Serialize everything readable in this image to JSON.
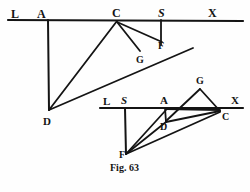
{
  "figure": {
    "caption": "Fig. 63",
    "caption_pos": {
      "x": 110,
      "y": 162,
      "size": 10
    },
    "background": "#fefefe",
    "ink": "#141414",
    "diagrams": [
      {
        "name": "upper-diagram",
        "baseline": {
          "label_line": "L A C S X",
          "y": 20,
          "x1": 8,
          "x2": 243
        },
        "points": [
          {
            "id": "L",
            "label": "L",
            "style": "bold",
            "x": 11,
            "y": 8,
            "size": 12,
            "vertex_x": 16,
            "vertex_y": 20
          },
          {
            "id": "A",
            "label": "A",
            "style": "bold",
            "x": 37,
            "y": 8,
            "size": 12,
            "vertex_x": 48,
            "vertex_y": 20
          },
          {
            "id": "C",
            "label": "C",
            "style": "bold",
            "x": 112,
            "y": 7,
            "size": 12,
            "vertex_x": 117,
            "vertex_y": 21
          },
          {
            "id": "S",
            "label": "S",
            "style": "italic",
            "x": 158,
            "y": 7,
            "size": 12,
            "vertex_x": 161,
            "vertex_y": 21
          },
          {
            "id": "X",
            "label": "X",
            "style": "bold",
            "x": 208,
            "y": 7,
            "size": 12,
            "vertex_x": 213,
            "vertex_y": 20
          },
          {
            "id": "F",
            "label": "F",
            "style": "bold",
            "x": 158,
            "y": 41,
            "size": 10,
            "vertex_x": 161,
            "vertex_y": 42
          },
          {
            "id": "G",
            "label": "G",
            "style": "bold",
            "x": 136,
            "y": 55,
            "size": 10,
            "vertex_x": 139,
            "vertex_y": 52
          },
          {
            "id": "D",
            "label": "D",
            "style": "bold",
            "x": 43,
            "y": 116,
            "size": 11,
            "vertex_x": 49,
            "vertex_y": 110
          }
        ],
        "segments": [
          {
            "name": "baseline-LX",
            "from": [
              8,
              20
            ],
            "to": [
              243,
              21
            ],
            "width": 2.2
          },
          {
            "name": "vertical-A-D",
            "from": [
              48,
              20
            ],
            "to": [
              49,
              110
            ],
            "width": 2.0
          },
          {
            "name": "vertical-S-F",
            "from": [
              161,
              20
            ],
            "to": [
              161,
              45
            ],
            "width": 1.8
          },
          {
            "name": "line-C-D",
            "from": [
              117,
              21
            ],
            "to": [
              49,
              110
            ],
            "width": 1.8
          },
          {
            "name": "line-C-G",
            "from": [
              117,
              22
            ],
            "to": [
              140,
              51
            ],
            "width": 1.8
          },
          {
            "name": "line-C-F",
            "from": [
              117,
              22
            ],
            "to": [
              162,
              42
            ],
            "width": 1.8
          },
          {
            "name": "line-D-through-G-F",
            "from": [
              49,
              110
            ],
            "to": [
              193,
              48
            ],
            "width": 1.8
          }
        ]
      },
      {
        "name": "lower-diagram",
        "baseline": {
          "label_line": "L S A X",
          "y": 108,
          "x1": 100,
          "x2": 243
        },
        "points": [
          {
            "id": "L",
            "label": "L",
            "style": "bold",
            "x": 103,
            "y": 96,
            "size": 11,
            "vertex_x": 108,
            "vertex_y": 108
          },
          {
            "id": "S",
            "label": "S",
            "style": "italic",
            "x": 121,
            "y": 95,
            "size": 11,
            "vertex_x": 125,
            "vertex_y": 108
          },
          {
            "id": "A",
            "label": "A",
            "style": "bold",
            "x": 160,
            "y": 95,
            "size": 11,
            "vertex_x": 165,
            "vertex_y": 108
          },
          {
            "id": "X",
            "label": "X",
            "style": "bold",
            "x": 231,
            "y": 95,
            "size": 11,
            "vertex_x": 236,
            "vertex_y": 108
          },
          {
            "id": "G",
            "label": "G",
            "style": "bold",
            "x": 196,
            "y": 76,
            "size": 10,
            "vertex_x": 200,
            "vertex_y": 89
          },
          {
            "id": "C",
            "label": "C",
            "style": "bold",
            "x": 222,
            "y": 112,
            "size": 10,
            "vertex_x": 220,
            "vertex_y": 110
          },
          {
            "id": "D",
            "label": "D",
            "style": "bold",
            "x": 160,
            "y": 122,
            "size": 10,
            "vertex_x": 166,
            "vertex_y": 121
          },
          {
            "id": "F",
            "label": "F",
            "style": "bold",
            "x": 119,
            "y": 150,
            "size": 10,
            "vertex_x": 126,
            "vertex_y": 154
          }
        ],
        "segments": [
          {
            "name": "baseline-LX",
            "from": [
              100,
              108
            ],
            "to": [
              243,
              108
            ],
            "width": 2.2
          },
          {
            "name": "vertical-S-F",
            "from": [
              125,
              108
            ],
            "to": [
              126,
              154
            ],
            "width": 2.0
          },
          {
            "name": "vertical-A-D",
            "from": [
              165,
              108
            ],
            "to": [
              166,
              122
            ],
            "width": 1.8
          },
          {
            "name": "line-G-C",
            "from": [
              200,
              89
            ],
            "to": [
              220,
              111
            ],
            "width": 1.8
          },
          {
            "name": "line-G-D",
            "from": [
              200,
              89
            ],
            "to": [
              166,
              121
            ],
            "width": 1.8
          },
          {
            "name": "line-A-C",
            "from": [
              166,
              109
            ],
            "to": [
              220,
              110
            ],
            "width": 1.8
          },
          {
            "name": "line-D-C",
            "from": [
              166,
              122
            ],
            "to": [
              220,
              111
            ],
            "width": 1.8
          },
          {
            "name": "line-F-C",
            "from": [
              126,
              154
            ],
            "to": [
              220,
              112
            ],
            "width": 1.8
          },
          {
            "name": "line-F-D",
            "from": [
              126,
              154
            ],
            "to": [
              166,
              122
            ],
            "width": 1.8
          },
          {
            "name": "line-F-A",
            "from": [
              126,
              154
            ],
            "to": [
              166,
              110
            ],
            "width": 1.8
          }
        ]
      }
    ]
  }
}
